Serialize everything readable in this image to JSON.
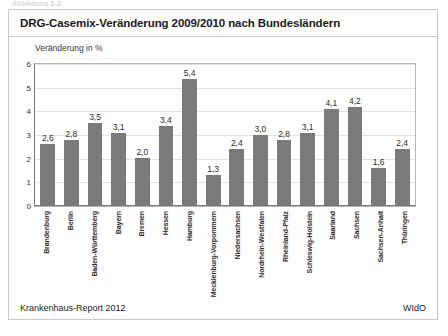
{
  "figure": {
    "caption_stub": "Abbildung 1-2",
    "title": "DRG-Casemix-Veränderung 2009/2010 nach Bundesländern",
    "source_left": "Krankenhaus-Report 2012",
    "source_right": "WIdO"
  },
  "colors": {
    "bar": "#7a7a7a",
    "frame": "#c8c8c8",
    "grid": "#e2e2e2",
    "axis": "#7a7a7a",
    "text": "#231f20"
  },
  "chart_data": {
    "type": "bar",
    "title": "DRG-Casemix-Veränderung 2009/2010 nach Bundesländern",
    "subtitle": "",
    "xlabel": "",
    "ylabel": "Veränderung in %",
    "ylim": [
      0,
      6
    ],
    "yticks": [
      "6",
      "5",
      "4",
      "3",
      "2",
      "1",
      "0"
    ],
    "ytick_values": [
      6,
      5,
      4,
      3,
      2,
      1,
      0
    ],
    "grid": true,
    "legend": false,
    "decimal_separator": ",",
    "categories": [
      "Brandenburg",
      "Berlin",
      "Baden-Württemberg",
      "Bayern",
      "Bremen",
      "Hessen",
      "Hamburg",
      "Mecklenburg-Vorpommern",
      "Niedersachsen",
      "Nordrhein-Westfalen",
      "Rheinland-Pfalz",
      "Schleswig-Holstein",
      "Saarland",
      "Sachsen",
      "Sachsen-Anhalt",
      "Thüringen"
    ],
    "values": [
      2.6,
      2.8,
      3.5,
      3.1,
      2.0,
      3.4,
      5.4,
      1.3,
      2.4,
      3.0,
      2.8,
      3.1,
      4.1,
      4.2,
      1.6,
      2.4
    ],
    "labels": [
      "2,6",
      "2,8",
      "3,5",
      "3,1",
      "2,0",
      "3,4",
      "5,4",
      "1,3",
      "2,4",
      "3,0",
      "2,8",
      "3,1",
      "4,1",
      "4,2",
      "1,6",
      "2,4"
    ]
  }
}
